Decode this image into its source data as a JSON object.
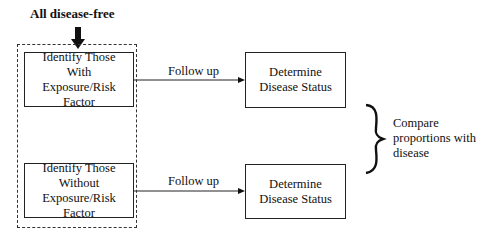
{
  "diagram": {
    "title": "All disease-free",
    "group_box": "dashed-study-population",
    "exposed_box": {
      "lines": [
        "Identify Those",
        "With",
        "Exposure/Risk Factor"
      ]
    },
    "unexposed_box": {
      "lines": [
        "Identify Those",
        "Without",
        "Exposure/Risk Factor"
      ]
    },
    "arrow_top_label": "Follow up",
    "arrow_bottom_label": "Follow up",
    "outcome_top_box": {
      "lines": [
        "Determine",
        "Disease Status"
      ]
    },
    "outcome_bottom_box": {
      "lines": [
        "Determine",
        "Disease Status"
      ]
    },
    "comparison": {
      "lines": [
        "Compare",
        "proportions with",
        "disease"
      ]
    }
  }
}
